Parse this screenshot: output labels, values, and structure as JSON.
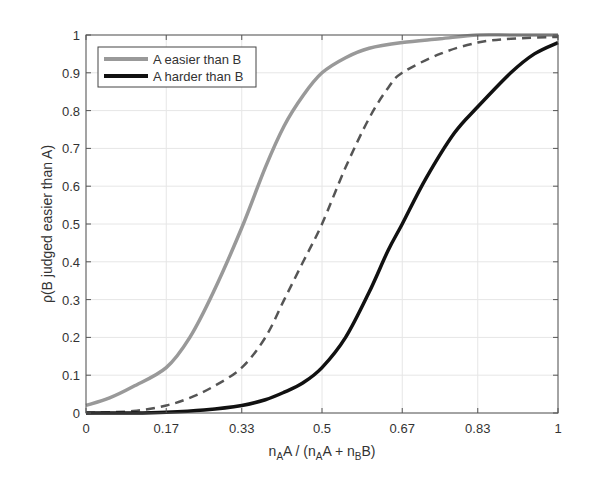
{
  "chart_data": {
    "type": "line",
    "title": "",
    "xlabel": "n_A A / (n_A A + n_B B)",
    "ylabel": "ρ(B judged easier than A)",
    "xlim": [
      0,
      1
    ],
    "ylim": [
      0,
      1
    ],
    "grid": true,
    "legend_position": "upper left",
    "x_ticks": [
      0,
      0.17,
      0.33,
      0.5,
      0.67,
      0.83,
      1
    ],
    "x_tick_labels": [
      "0",
      "0.17",
      "0.33",
      "0.5",
      "0.67",
      "0.83",
      "1"
    ],
    "y_ticks": [
      0,
      0.1,
      0.2,
      0.3,
      0.4,
      0.5,
      0.6,
      0.7,
      0.8,
      0.9,
      1
    ],
    "y_tick_labels": [
      "0",
      "0.1",
      "0.2",
      "0.3",
      "0.4",
      "0.5",
      "0.6",
      "0.7",
      "0.8",
      "0.9",
      "1"
    ],
    "series": [
      {
        "name": "A easier than B",
        "style": "solid",
        "color": "#999999",
        "x": [
          0,
          0.05,
          0.1,
          0.17,
          0.22,
          0.27,
          0.33,
          0.38,
          0.42,
          0.46,
          0.5,
          0.55,
          0.6,
          0.67,
          0.75,
          0.83,
          0.9,
          1
        ],
        "y": [
          0.02,
          0.04,
          0.07,
          0.12,
          0.2,
          0.32,
          0.49,
          0.65,
          0.76,
          0.84,
          0.9,
          0.94,
          0.965,
          0.98,
          0.99,
          1.0,
          1.0,
          1.0
        ]
      },
      {
        "name": "",
        "style": "dashed",
        "color": "#555555",
        "x": [
          0,
          0.1,
          0.17,
          0.22,
          0.27,
          0.33,
          0.38,
          0.42,
          0.46,
          0.5,
          0.55,
          0.6,
          0.64,
          0.67,
          0.75,
          0.83,
          0.9,
          1
        ],
        "y": [
          0.0,
          0.005,
          0.02,
          0.04,
          0.07,
          0.12,
          0.2,
          0.3,
          0.4,
          0.5,
          0.65,
          0.78,
          0.86,
          0.9,
          0.95,
          0.98,
          0.99,
          0.995
        ]
      },
      {
        "name": "A harder than B",
        "style": "solid",
        "color": "#111111",
        "x": [
          0,
          0.1,
          0.17,
          0.25,
          0.33,
          0.38,
          0.42,
          0.46,
          0.5,
          0.55,
          0.6,
          0.64,
          0.67,
          0.72,
          0.78,
          0.83,
          0.9,
          0.95,
          1
        ],
        "y": [
          0.0,
          0.0,
          0.002,
          0.008,
          0.02,
          0.035,
          0.055,
          0.08,
          0.12,
          0.2,
          0.32,
          0.43,
          0.5,
          0.62,
          0.74,
          0.81,
          0.9,
          0.95,
          0.98
        ]
      }
    ]
  },
  "legend": {
    "items": [
      {
        "label": "A easier than B",
        "color": "#999999"
      },
      {
        "label": "A harder than B",
        "color": "#111111"
      }
    ]
  },
  "axes": {
    "xlabel_parts": {
      "n1": "n",
      "sub1": "A",
      "t1": "A / (n",
      "sub2": "A",
      "t2": "A + n",
      "sub3": "B",
      "t3": "B)"
    },
    "ylabel": "ρ(B judged easier than A)"
  }
}
